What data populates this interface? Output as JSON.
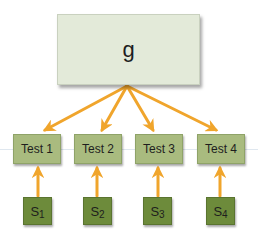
{
  "diagram": {
    "root": {
      "label": "g"
    },
    "tests": [
      {
        "label": "Test 1"
      },
      {
        "label": "Test 2"
      },
      {
        "label": "Test 3"
      },
      {
        "label": "Test 4"
      }
    ],
    "sources": [
      {
        "base": "S",
        "sub": "1"
      },
      {
        "base": "S",
        "sub": "2"
      },
      {
        "base": "S",
        "sub": "3"
      },
      {
        "base": "S",
        "sub": "4"
      }
    ],
    "edges": [
      {
        "from": "g",
        "to": "Test 1"
      },
      {
        "from": "g",
        "to": "Test 2"
      },
      {
        "from": "g",
        "to": "Test 3"
      },
      {
        "from": "g",
        "to": "Test 4"
      },
      {
        "from": "S1",
        "to": "Test 1"
      },
      {
        "from": "S2",
        "to": "Test 2"
      },
      {
        "from": "S3",
        "to": "Test 3"
      },
      {
        "from": "S4",
        "to": "Test 4"
      }
    ],
    "colors": {
      "root_fill": "#e3ead9",
      "test_fill": "#a9bb7f",
      "source_fill": "#6d8b3b",
      "arrow": "#f0a52c"
    }
  }
}
